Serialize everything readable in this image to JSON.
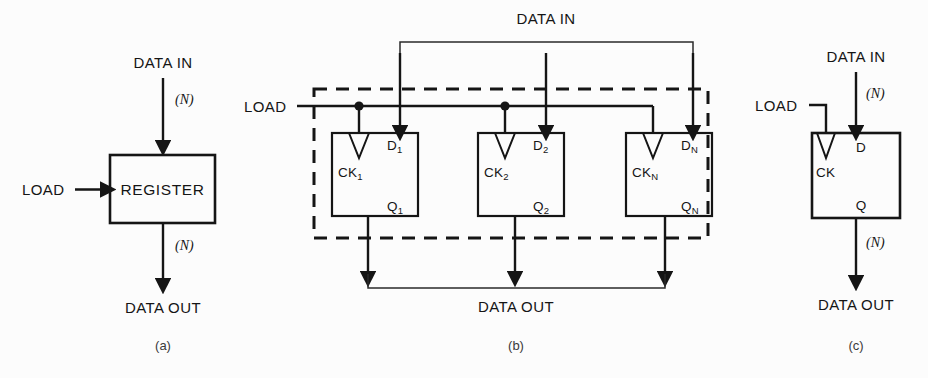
{
  "figure": {
    "panels": [
      {
        "id": "a",
        "caption": "(a)",
        "block_label": "REGISTER",
        "data_in": "DATA IN",
        "data_out": "DATA OUT",
        "load": "LOAD",
        "width_in": "(N)",
        "width_out": "(N)"
      },
      {
        "id": "b",
        "caption": "(b)",
        "data_in": "DATA IN",
        "data_out": "DATA OUT",
        "load": "LOAD",
        "flipflops": [
          {
            "clock": "CK",
            "clock_sub": "1",
            "d": "D",
            "d_sub": "1",
            "q": "Q",
            "q_sub": "1"
          },
          {
            "clock": "CK",
            "clock_sub": "2",
            "d": "D",
            "d_sub": "2",
            "q": "Q",
            "q_sub": "2"
          },
          {
            "clock": "CK",
            "clock_sub": "N",
            "d": "D",
            "d_sub": "N",
            "q": "Q",
            "q_sub": "N"
          }
        ]
      },
      {
        "id": "c",
        "caption": "(c)",
        "data_in": "DATA IN",
        "data_out": "DATA OUT",
        "load": "LOAD",
        "width_in": "(N)",
        "width_out": "(N)",
        "clock": "CK",
        "d": "D",
        "q": "Q"
      }
    ],
    "colors": {
      "ink": "#151515",
      "background": "#fcfcfc"
    }
  }
}
